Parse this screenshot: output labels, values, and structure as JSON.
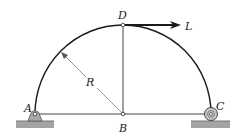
{
  "figure": {
    "labels": {
      "A": "A",
      "B": "B",
      "C": "C",
      "D": "D",
      "L": "L",
      "R": "R"
    },
    "elements": {
      "arch": "semicircular arch A-D-C",
      "base_member": "horizontal member A-B-C",
      "vertical_member": "vertical member B-D",
      "load": "horizontal force L applied at D",
      "support_A": "pin support",
      "support_C": "roller support",
      "dimension": "radius R"
    },
    "colors": {
      "line": "#1a1a1a",
      "member": "#555555",
      "ground": "#9a9a9a",
      "support": "#a8a8a8"
    }
  }
}
